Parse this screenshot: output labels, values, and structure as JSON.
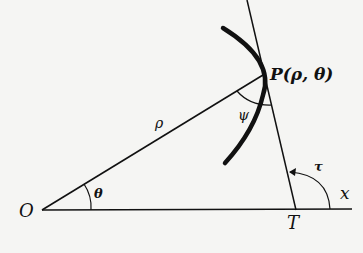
{
  "diagram": {
    "labels": {
      "origin": "O",
      "point": "P(ρ, θ)",
      "radius": "ρ",
      "angle_theta": "θ",
      "angle_psi": "ψ",
      "angle_tau": "τ",
      "tangent_foot": "T",
      "axis": "x"
    },
    "colors": {
      "ink": "#111111",
      "paper": "#f5f5f3"
    }
  }
}
